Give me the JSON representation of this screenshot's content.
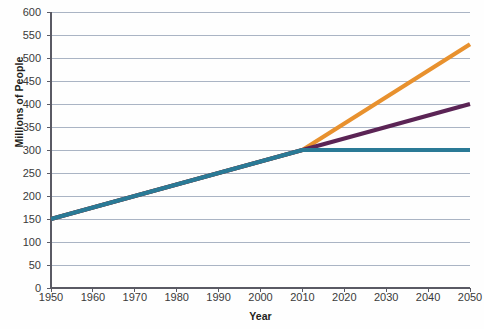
{
  "chart_data": {
    "type": "line",
    "title": "",
    "xlabel": "Year",
    "ylabel": "Millions of People",
    "xlim": [
      1950,
      2050
    ],
    "ylim": [
      0,
      600
    ],
    "grid": true,
    "legend": "none",
    "x_ticks": [
      1950,
      1960,
      1970,
      1980,
      1990,
      2000,
      2010,
      2020,
      2030,
      2040,
      2050
    ],
    "y_ticks": [
      0,
      50,
      100,
      150,
      200,
      250,
      300,
      350,
      400,
      450,
      500,
      550,
      600
    ],
    "series": [
      {
        "name": "high-projection",
        "color": "#e8912e",
        "x": [
          1950,
          2010,
          2050
        ],
        "values": [
          150,
          300,
          530
        ]
      },
      {
        "name": "middle-projection",
        "color": "#5b2455",
        "x": [
          1950,
          2010,
          2050
        ],
        "values": [
          150,
          300,
          400
        ]
      },
      {
        "name": "low-projection",
        "color": "#2a7a96",
        "x": [
          1950,
          2010,
          2050
        ],
        "values": [
          150,
          300,
          300
        ]
      }
    ]
  },
  "axes": {
    "y_title": "Millions of People",
    "x_title": "Year",
    "y_tick_labels": [
      "600",
      "550",
      "500",
      "450",
      "400",
      "350",
      "300",
      "250",
      "200",
      "150",
      "100",
      "50",
      "0"
    ],
    "x_tick_labels": [
      "1950",
      "1960",
      "1970",
      "1980",
      "1990",
      "2000",
      "2010",
      "2020",
      "2030",
      "2040",
      "2050"
    ]
  },
  "colors": {
    "grid": "#aab4c4",
    "axis": "#5a5a64",
    "high": "#e8912e",
    "middle": "#5b2455",
    "low": "#2a7a96",
    "text": "#231f20"
  }
}
